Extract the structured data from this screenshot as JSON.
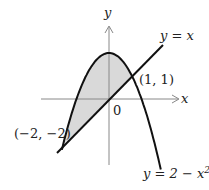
{
  "diagram": {
    "type": "region-between-curves",
    "axes": {
      "x_label": "x",
      "y_label": "y",
      "origin_label": "0"
    },
    "curves": [
      {
        "name": "line",
        "equation_label": "y = x"
      },
      {
        "name": "parabola",
        "equation_label": "y = 2 − x²"
      }
    ],
    "intersection_points": [
      {
        "label": "(1, 1)",
        "x": 1,
        "y": 1
      },
      {
        "label": "(−2, −2)",
        "x": -2,
        "y": -2
      }
    ],
    "shaded_region": {
      "between": [
        "y = 2 − x²",
        "y = x"
      ],
      "x_range": [
        -2,
        1
      ],
      "fill": "#d9d9d9"
    },
    "colors": {
      "curve": "#111111",
      "axis": "#888888",
      "fill": "#d9d9d9"
    }
  },
  "labels": {
    "y_axis": "y",
    "x_axis": "x",
    "origin": "0",
    "line_eq": "y = x",
    "parabola_eq_prefix": "y = 2 − x",
    "parabola_eq_sup": "2",
    "point_a": "(1, 1)",
    "point_b": "(−2, −2)"
  }
}
